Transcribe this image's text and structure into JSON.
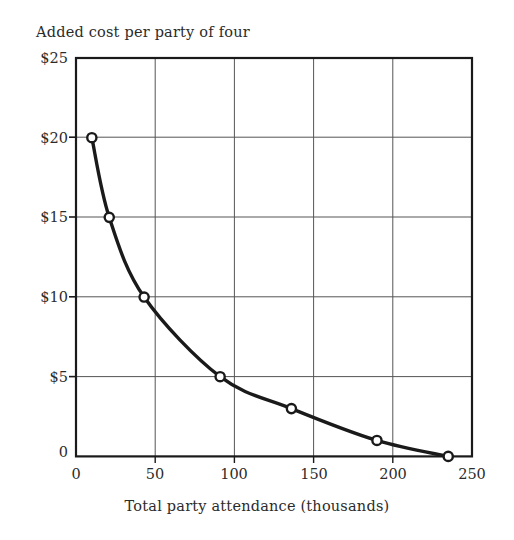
{
  "chart_data": {
    "type": "line",
    "title": "Added cost per party of four",
    "xlabel": "Total party attendance (thousands)",
    "ylabel": "Added cost per party of four",
    "xlim": [
      0,
      250
    ],
    "ylim": [
      0,
      25
    ],
    "grid": true,
    "legend": null,
    "marker": "open-circle",
    "x": [
      10,
      21,
      43,
      91,
      136,
      190,
      235
    ],
    "values": [
      20,
      15,
      10,
      5,
      3,
      1,
      0
    ],
    "points": [
      {
        "x": 10,
        "y": 20
      },
      {
        "x": 21,
        "y": 15
      },
      {
        "x": 43,
        "y": 10
      },
      {
        "x": 91,
        "y": 5
      },
      {
        "x": 136,
        "y": 3
      },
      {
        "x": 190,
        "y": 1
      },
      {
        "x": 235,
        "y": 0
      }
    ],
    "xticks": [
      0,
      50,
      100,
      150,
      200,
      250
    ],
    "xtick_labels": [
      "0",
      "50",
      "100",
      "150",
      "200",
      "250"
    ],
    "yticks": [
      0,
      5,
      10,
      15,
      20,
      25
    ],
    "ytick_labels": [
      "0",
      "$5",
      "$10",
      "$15",
      "$20",
      "$25"
    ],
    "line_color": "#1a1a1a",
    "marker_fill": "#ffffff",
    "axis_color": "#1a1a1a",
    "grid_color": "#555555",
    "background": "#ffffff"
  },
  "axis": {
    "y_labels": [
      "$25",
      "$20",
      "$15",
      "$10",
      "$5",
      "0"
    ],
    "x_labels": [
      "0",
      "50",
      "100",
      "150",
      "200",
      "250"
    ]
  }
}
